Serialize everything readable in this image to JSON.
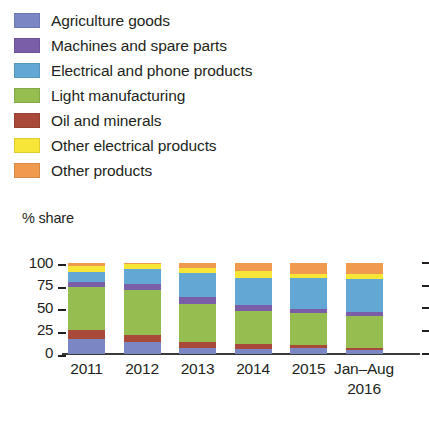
{
  "legend": {
    "items": [
      {
        "label": "Agriculture goods",
        "color": "#7b86c4",
        "icon": "color-swatch"
      },
      {
        "label": "Machines and spare parts",
        "color": "#7b5ea8",
        "icon": "color-swatch"
      },
      {
        "label": "Electrical and phone products",
        "color": "#63a8d4",
        "icon": "color-swatch"
      },
      {
        "label": "Light manufacturing",
        "color": "#95bd50",
        "icon": "color-swatch"
      },
      {
        "label": "Oil and minerals",
        "color": "#a8493a",
        "icon": "color-swatch"
      },
      {
        "label": "Other electrical products",
        "color": "#f7e637",
        "icon": "color-swatch"
      },
      {
        "label": "Other products",
        "color": "#ef9a4e",
        "icon": "color-swatch"
      }
    ]
  },
  "axis": {
    "y_title": "% share",
    "y_ticks": [
      "100",
      "75",
      "50",
      "25",
      "0"
    ]
  },
  "chart_data": {
    "type": "bar",
    "stacked": true,
    "title": "",
    "xlabel": "",
    "ylabel": "% share",
    "ylim": [
      0,
      100
    ],
    "grid": false,
    "legend_position": "top",
    "categories": [
      "2011",
      "2012",
      "2013",
      "2014",
      "2015",
      "Jan–Aug 2016"
    ],
    "category_labels": [
      {
        "line1": "2011",
        "line2": ""
      },
      {
        "line1": "2012",
        "line2": ""
      },
      {
        "line1": "2013",
        "line2": ""
      },
      {
        "line1": "2014",
        "line2": ""
      },
      {
        "line1": "2015",
        "line2": ""
      },
      {
        "line1": "Jan–Aug",
        "line2": "2016"
      }
    ],
    "series": [
      {
        "name": "Agriculture goods",
        "color": "#7b86c4",
        "values": [
          16,
          13,
          6,
          5,
          6,
          4
        ]
      },
      {
        "name": "Oil and minerals",
        "color": "#a8493a",
        "values": [
          10,
          8,
          7,
          5,
          3,
          2
        ]
      },
      {
        "name": "Light manufacturing",
        "color": "#95bd50",
        "values": [
          48,
          49,
          42,
          37,
          36,
          36
        ]
      },
      {
        "name": "Machines and spare parts",
        "color": "#7b5ea8",
        "values": [
          5,
          7,
          7,
          7,
          4,
          4
        ]
      },
      {
        "name": "Electrical and phone products",
        "color": "#63a8d4",
        "values": [
          11,
          16,
          27,
          30,
          34,
          36
        ]
      },
      {
        "name": "Other electrical products",
        "color": "#f7e637",
        "values": [
          7,
          6,
          6,
          7,
          5,
          6
        ]
      },
      {
        "name": "Other products",
        "color": "#ef9a4e",
        "values": [
          3,
          1,
          5,
          9,
          12,
          12
        ]
      }
    ]
  }
}
